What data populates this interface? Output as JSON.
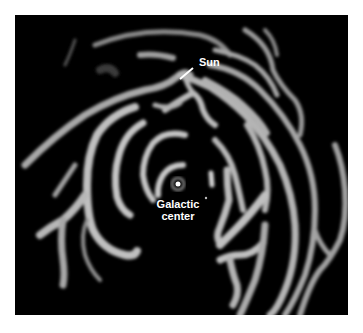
{
  "figure": {
    "background_color": "#000000",
    "arm_color": "#bdbdbd",
    "labels": {
      "sun": "Sun",
      "galactic_center_line1": "Galactic",
      "galactic_center_line2": "center"
    }
  }
}
